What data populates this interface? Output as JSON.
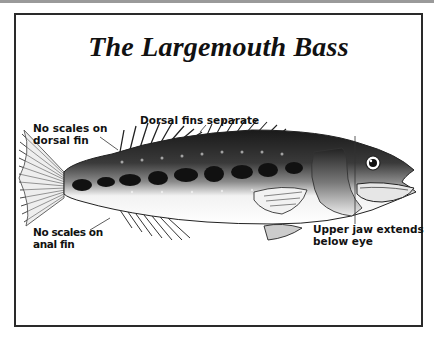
{
  "title": "The Largemouth Bass",
  "labels": {
    "dorsal_separate": "Dorsal fins separate",
    "dorsal_noscale_line1": "No scales on",
    "dorsal_noscale_line2": "dorsal fin",
    "anal_noscale_line1": "No scales on",
    "anal_noscale_line2": "anal fin",
    "jaw_line1": "Upper jaw extends",
    "jaw_line2": "below eye"
  },
  "colors": {
    "frame_border": "#2a2a2a",
    "ink": "#111111",
    "background": "#ffffff"
  }
}
